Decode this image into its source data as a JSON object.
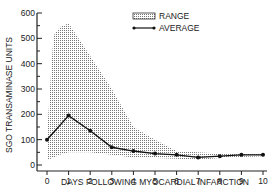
{
  "chart_data": {
    "type": "line",
    "title": "",
    "xlabel": "DAYS FOLLOWING MYOCARDIAL INFARCTION",
    "ylabel": "SGO TRANSAMINASE UNITS",
    "x": [
      0,
      1,
      2,
      3,
      4,
      5,
      6,
      7,
      8,
      9,
      10
    ],
    "xticks": [
      "0",
      "1",
      "2",
      "3",
      "4",
      "5",
      "6",
      "7",
      "8",
      "9",
      "10"
    ],
    "yticks": [
      "0",
      "100",
      "200",
      "300",
      "400",
      "500",
      "600"
    ],
    "xlim": [
      0,
      10
    ],
    "ylim": [
      0,
      600
    ],
    "grid": false,
    "legend_position": "top-right",
    "series": [
      {
        "name": "AVERAGE",
        "type": "line",
        "values": [
          100,
          195,
          135,
          70,
          55,
          45,
          40,
          30,
          35,
          40,
          40
        ]
      },
      {
        "name": "RANGE",
        "type": "area",
        "x": [
          0,
          0.3,
          0.6,
          1,
          2,
          3,
          4,
          5,
          6,
          7,
          8,
          9,
          10
        ],
        "upper": [
          120,
          510,
          545,
          560,
          430,
          300,
          150,
          100,
          55,
          50,
          45,
          45,
          45
        ],
        "lower": [
          20,
          30,
          40,
          50,
          50,
          40,
          30,
          28,
          25,
          20,
          28,
          32,
          35
        ]
      }
    ]
  },
  "legend": {
    "range_label": "RANGE",
    "average_label": "AVERAGE"
  },
  "axes": {
    "xlabel": "DAYS FOLLOWING MYOCARDIAL INFARCTION",
    "ylabel": "SGO TRANSAMINASE UNITS"
  }
}
